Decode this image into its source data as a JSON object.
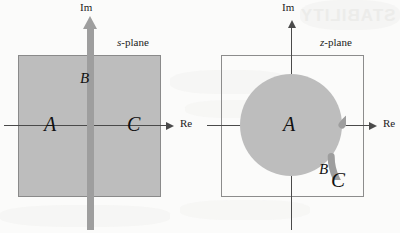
{
  "figure": {
    "background_color": "#fbfbfa",
    "bleed_through_text": "STABILITY",
    "fill_color": "#bdbdbd",
    "ring_color": "#9e9e9e",
    "axis_color": "#4a4a4a",
    "box_border_color": "#8c8c8c"
  },
  "panels": [
    {
      "id": "s-plane",
      "plane_label_italic": "s",
      "plane_label_rest": "-plane",
      "axes": {
        "real_label": "Re",
        "imag_label": "Im"
      },
      "regions": [
        {
          "key": "A",
          "label": "A",
          "meaning": "left-half plane (stable region)"
        },
        {
          "key": "B",
          "label": "B",
          "meaning": "imaginary axis (marginally stable)"
        },
        {
          "key": "C",
          "label": "C",
          "meaning": "right-half plane (unstable region)"
        }
      ]
    },
    {
      "id": "z-plane",
      "plane_label_italic": "z",
      "plane_label_rest": "-plane",
      "axes": {
        "real_label": "Re",
        "imag_label": "Im"
      },
      "regions": [
        {
          "key": "A",
          "label": "A",
          "meaning": "inside unit circle (stable region)"
        },
        {
          "key": "B",
          "label": "B",
          "meaning": "on unit circle (marginally stable)"
        },
        {
          "key": "C",
          "label": "C",
          "meaning": "outside unit circle (unstable region)"
        }
      ]
    }
  ]
}
